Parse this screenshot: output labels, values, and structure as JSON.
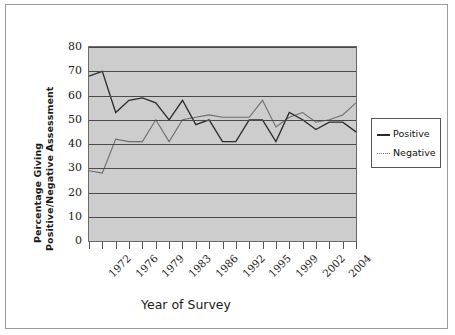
{
  "axes": {
    "ylabel_line1": "Percentage Giving",
    "ylabel_line2": "Positive/Negative Assessment",
    "xlabel": "Year of Survey",
    "yticks": [
      "80",
      "70",
      "60",
      "50",
      "40",
      "30",
      "20",
      "10",
      "0"
    ]
  },
  "legend": {
    "items": [
      {
        "label": "Positive",
        "style": "solid",
        "color": "#2b2b2b"
      },
      {
        "label": "Negative",
        "style": "dotted",
        "color": "#6e6e6e"
      }
    ]
  },
  "colors": {
    "plot_background": "#cdcdcd",
    "gridline": "#4a4a4a",
    "axis": "#6a6a6a",
    "positive_series": "#2b2b2b",
    "negative_series": "#6e6e6e",
    "frame_border": "#9a9a9a",
    "text": "#1a1a1a"
  },
  "chart_data": {
    "type": "line",
    "title": "",
    "subtitle": "",
    "xlabel": "Year of Survey",
    "ylabel": "Percentage Giving Positive/Negative Assessment",
    "ylim": [
      0,
      80
    ],
    "ytick_values": [
      0,
      10,
      20,
      30,
      40,
      50,
      60,
      70,
      80
    ],
    "grid": true,
    "grid_axis": "y",
    "legend_position": "right-outside",
    "tick_labels": [
      "1972",
      "1976",
      "1979",
      "1983",
      "1986",
      "1992",
      "1995",
      "1999",
      "2002",
      "2004"
    ],
    "tick_label_every": 2,
    "n_points": 21,
    "x": [
      1,
      2,
      3,
      4,
      5,
      6,
      7,
      8,
      9,
      10,
      11,
      12,
      13,
      14,
      15,
      16,
      17,
      18,
      19,
      20,
      21
    ],
    "series": [
      {
        "name": "Positive",
        "style": "solid",
        "values": [
          68,
          70,
          53,
          58,
          59,
          57,
          50,
          58,
          48,
          50,
          41,
          41,
          50,
          50,
          41,
          53,
          50,
          46,
          49,
          49,
          45
        ]
      },
      {
        "name": "Negative",
        "style": "dotted",
        "values": [
          29,
          28,
          42,
          41,
          41,
          50,
          41,
          50,
          51,
          52,
          51,
          51,
          51,
          58,
          47,
          51,
          53,
          49,
          50,
          52,
          57
        ]
      }
    ],
    "annotations": []
  }
}
